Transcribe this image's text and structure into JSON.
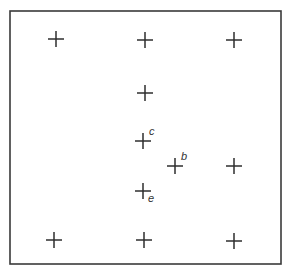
{
  "canvas": {
    "width": 290,
    "height": 274,
    "background": "#ffffff"
  },
  "frame": {
    "x1": 10,
    "y1": 11,
    "x2": 281,
    "y2": 264,
    "color": "#3a3a3a"
  },
  "cross_half_size": 8,
  "crosses": [
    {
      "id": "top-left",
      "x": 56,
      "y": 39,
      "label": ""
    },
    {
      "id": "top-center",
      "x": 145,
      "y": 40,
      "label": ""
    },
    {
      "id": "top-right",
      "x": 234,
      "y": 40,
      "label": ""
    },
    {
      "id": "upper-center",
      "x": 145,
      "y": 93,
      "label": ""
    },
    {
      "id": "c",
      "x": 143,
      "y": 141,
      "label": "c",
      "label_dx": 6,
      "label_dy": -6
    },
    {
      "id": "b",
      "x": 175,
      "y": 166,
      "label": "b",
      "label_dx": 6,
      "label_dy": -6
    },
    {
      "id": "mid-right",
      "x": 234,
      "y": 166,
      "label": ""
    },
    {
      "id": "e",
      "x": 143,
      "y": 191,
      "label": "e",
      "label_dx": 5,
      "label_dy": 11
    },
    {
      "id": "bottom-left",
      "x": 54,
      "y": 240,
      "label": ""
    },
    {
      "id": "bottom-center",
      "x": 144,
      "y": 240,
      "label": ""
    },
    {
      "id": "bottom-right",
      "x": 234,
      "y": 241,
      "label": ""
    }
  ],
  "labels": {
    "c": "c",
    "b": "b",
    "e": "e"
  }
}
